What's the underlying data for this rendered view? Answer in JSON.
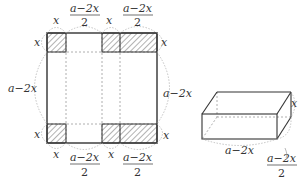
{
  "diagram": {
    "net": {
      "top_labels": [
        "x",
        "a−2x",
        "2",
        "x",
        "a−2x",
        "2"
      ],
      "left_labels": [
        "x",
        "a−2x",
        "x"
      ],
      "right_labels": [
        "x",
        "a−2x",
        "x"
      ],
      "bottom_labels": [
        "x",
        "a−2x",
        "2",
        "x",
        "a−2x",
        "2"
      ]
    },
    "box": {
      "height_label": "x",
      "length_label": "a−2x",
      "depth_numerator": "a−2x",
      "depth_denominator": "2"
    },
    "colors": {
      "stroke": "#333333",
      "hatch": "#555555",
      "dashed": "#999999"
    }
  }
}
